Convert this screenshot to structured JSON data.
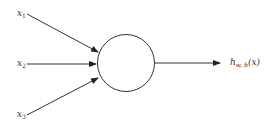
{
  "diagram": {
    "type": "neuron",
    "inputs": [
      {
        "label": "x",
        "subscript": "1"
      },
      {
        "label": "x",
        "subscript": "2"
      },
      {
        "label": "x",
        "subscript": "3"
      }
    ],
    "node": {
      "shape": "circle"
    },
    "output": {
      "label": "h",
      "subscript": "w, b",
      "argument": "(x)"
    },
    "colors": {
      "stroke": "#333333",
      "background": "#ffffff"
    }
  }
}
